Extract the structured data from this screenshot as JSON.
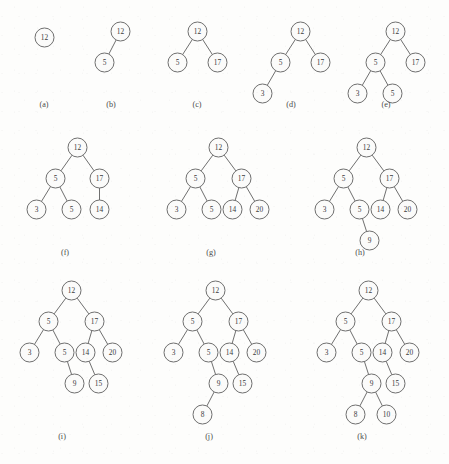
{
  "figure": {
    "background_color": "#fdfdfc",
    "node_stroke_color": "#6f6f6f",
    "node_fill_color": "#fbfbfa",
    "label_color": "#3a3a3a",
    "node_radius": 9.5,
    "insertion_sequence": [
      12,
      5,
      17,
      3,
      5,
      14,
      20,
      9,
      15,
      8,
      10
    ]
  },
  "trees": [
    {
      "caption": "(a)",
      "origin": {
        "x": 44,
        "y": 37
      },
      "caption_pos": {
        "x": 44,
        "y": 100
      },
      "nodes": [
        {
          "id": "a0",
          "value": "12",
          "x": 0,
          "y": 0
        }
      ],
      "edges": []
    },
    {
      "caption": "(b)",
      "origin": {
        "x": 120,
        "y": 31
      },
      "caption_pos": {
        "x": 111,
        "y": 100
      },
      "nodes": [
        {
          "id": "b0",
          "value": "12",
          "x": 0,
          "y": 0
        },
        {
          "id": "b1",
          "value": "5",
          "x": -16,
          "y": 31
        }
      ],
      "edges": [
        {
          "from": "b0",
          "to": "b1"
        }
      ]
    },
    {
      "caption": "(c)",
      "origin": {
        "x": 197,
        "y": 31
      },
      "caption_pos": {
        "x": 197,
        "y": 100
      },
      "nodes": [
        {
          "id": "c0",
          "value": "12",
          "x": 0,
          "y": 0
        },
        {
          "id": "c1",
          "value": "5",
          "x": -20,
          "y": 31
        },
        {
          "id": "c2",
          "value": "17",
          "x": 20,
          "y": 31
        }
      ],
      "edges": [
        {
          "from": "c0",
          "to": "c1"
        },
        {
          "from": "c0",
          "to": "c2"
        }
      ]
    },
    {
      "caption": "(d)",
      "origin": {
        "x": 300,
        "y": 31
      },
      "caption_pos": {
        "x": 291,
        "y": 100
      },
      "nodes": [
        {
          "id": "d0",
          "value": "12",
          "x": 0,
          "y": 0
        },
        {
          "id": "d1",
          "value": "5",
          "x": -20,
          "y": 31
        },
        {
          "id": "d2",
          "value": "17",
          "x": 20,
          "y": 31
        },
        {
          "id": "d3",
          "value": "3",
          "x": -38,
          "y": 62
        }
      ],
      "edges": [
        {
          "from": "d0",
          "to": "d1"
        },
        {
          "from": "d0",
          "to": "d2"
        },
        {
          "from": "d1",
          "to": "d3"
        }
      ]
    },
    {
      "caption": "(e)",
      "origin": {
        "x": 395,
        "y": 31
      },
      "caption_pos": {
        "x": 386,
        "y": 100
      },
      "nodes": [
        {
          "id": "e0",
          "value": "12",
          "x": 0,
          "y": 0
        },
        {
          "id": "e1",
          "value": "5",
          "x": -20,
          "y": 31
        },
        {
          "id": "e2",
          "value": "17",
          "x": 20,
          "y": 31
        },
        {
          "id": "e3",
          "value": "3",
          "x": -38,
          "y": 62
        },
        {
          "id": "e4",
          "value": "5",
          "x": -3,
          "y": 62
        }
      ],
      "edges": [
        {
          "from": "e0",
          "to": "e1"
        },
        {
          "from": "e0",
          "to": "e2"
        },
        {
          "from": "e1",
          "to": "e3"
        },
        {
          "from": "e1",
          "to": "e4"
        }
      ]
    },
    {
      "caption": "(f)",
      "origin": {
        "x": 77,
        "y": 147
      },
      "caption_pos": {
        "x": 65,
        "y": 248
      },
      "nodes": [
        {
          "id": "f0",
          "value": "12",
          "x": 0,
          "y": 0
        },
        {
          "id": "f1",
          "value": "5",
          "x": -22,
          "y": 31
        },
        {
          "id": "f2",
          "value": "17",
          "x": 22,
          "y": 31
        },
        {
          "id": "f3",
          "value": "3",
          "x": -41,
          "y": 62
        },
        {
          "id": "f4",
          "value": "5",
          "x": -6,
          "y": 62
        },
        {
          "id": "f5",
          "value": "14",
          "x": 22,
          "y": 62
        }
      ],
      "edges": [
        {
          "from": "f0",
          "to": "f1"
        },
        {
          "from": "f0",
          "to": "f2"
        },
        {
          "from": "f1",
          "to": "f3"
        },
        {
          "from": "f1",
          "to": "f4"
        },
        {
          "from": "f2",
          "to": "f5"
        }
      ]
    },
    {
      "caption": "(g)",
      "origin": {
        "x": 218,
        "y": 147
      },
      "caption_pos": {
        "x": 211,
        "y": 248
      },
      "nodes": [
        {
          "id": "g0",
          "value": "12",
          "x": 0,
          "y": 0
        },
        {
          "id": "g1",
          "value": "5",
          "x": -23,
          "y": 31
        },
        {
          "id": "g2",
          "value": "17",
          "x": 23,
          "y": 31
        },
        {
          "id": "g3",
          "value": "3",
          "x": -42,
          "y": 62
        },
        {
          "id": "g4",
          "value": "5",
          "x": -7,
          "y": 62
        },
        {
          "id": "g5",
          "value": "14",
          "x": 14,
          "y": 62
        },
        {
          "id": "g6",
          "value": "20",
          "x": 41,
          "y": 62
        }
      ],
      "edges": [
        {
          "from": "g0",
          "to": "g1"
        },
        {
          "from": "g0",
          "to": "g2"
        },
        {
          "from": "g1",
          "to": "g3"
        },
        {
          "from": "g1",
          "to": "g4"
        },
        {
          "from": "g2",
          "to": "g5"
        },
        {
          "from": "g2",
          "to": "g6"
        }
      ]
    },
    {
      "caption": "(h)",
      "origin": {
        "x": 366,
        "y": 147
      },
      "caption_pos": {
        "x": 360,
        "y": 248
      },
      "nodes": [
        {
          "id": "h0",
          "value": "12",
          "x": 0,
          "y": 0
        },
        {
          "id": "h1",
          "value": "5",
          "x": -23,
          "y": 31
        },
        {
          "id": "h2",
          "value": "17",
          "x": 23,
          "y": 31
        },
        {
          "id": "h3",
          "value": "3",
          "x": -42,
          "y": 62
        },
        {
          "id": "h4",
          "value": "5",
          "x": -7,
          "y": 62
        },
        {
          "id": "h5",
          "value": "14",
          "x": 14,
          "y": 62
        },
        {
          "id": "h6",
          "value": "20",
          "x": 41,
          "y": 62
        },
        {
          "id": "h7",
          "value": "9",
          "x": 3,
          "y": 93
        }
      ],
      "edges": [
        {
          "from": "h0",
          "to": "h1"
        },
        {
          "from": "h0",
          "to": "h2"
        },
        {
          "from": "h1",
          "to": "h3"
        },
        {
          "from": "h1",
          "to": "h4"
        },
        {
          "from": "h2",
          "to": "h5"
        },
        {
          "from": "h2",
          "to": "h6"
        },
        {
          "from": "h4",
          "to": "h7"
        }
      ]
    },
    {
      "caption": "(i)",
      "origin": {
        "x": 71,
        "y": 290
      },
      "caption_pos": {
        "x": 62,
        "y": 432
      },
      "nodes": [
        {
          "id": "i0",
          "value": "12",
          "x": 0,
          "y": 0
        },
        {
          "id": "i1",
          "value": "5",
          "x": -23,
          "y": 31
        },
        {
          "id": "i2",
          "value": "17",
          "x": 23,
          "y": 31
        },
        {
          "id": "i3",
          "value": "3",
          "x": -42,
          "y": 62
        },
        {
          "id": "i4",
          "value": "5",
          "x": -7,
          "y": 62
        },
        {
          "id": "i5",
          "value": "14",
          "x": 14,
          "y": 62
        },
        {
          "id": "i6",
          "value": "20",
          "x": 41,
          "y": 62
        },
        {
          "id": "i7",
          "value": "9",
          "x": 3,
          "y": 93
        },
        {
          "id": "i8",
          "value": "15",
          "x": 27,
          "y": 93
        }
      ],
      "edges": [
        {
          "from": "i0",
          "to": "i1"
        },
        {
          "from": "i0",
          "to": "i2"
        },
        {
          "from": "i1",
          "to": "i3"
        },
        {
          "from": "i1",
          "to": "i4"
        },
        {
          "from": "i2",
          "to": "i5"
        },
        {
          "from": "i2",
          "to": "i6"
        },
        {
          "from": "i4",
          "to": "i7"
        },
        {
          "from": "i5",
          "to": "i8"
        }
      ]
    },
    {
      "caption": "(j)",
      "origin": {
        "x": 215,
        "y": 290
      },
      "caption_pos": {
        "x": 209,
        "y": 432
      },
      "nodes": [
        {
          "id": "j0",
          "value": "12",
          "x": 0,
          "y": 0
        },
        {
          "id": "j1",
          "value": "5",
          "x": -23,
          "y": 31
        },
        {
          "id": "j2",
          "value": "17",
          "x": 23,
          "y": 31
        },
        {
          "id": "j3",
          "value": "3",
          "x": -42,
          "y": 62
        },
        {
          "id": "j4",
          "value": "5",
          "x": -7,
          "y": 62
        },
        {
          "id": "j5",
          "value": "14",
          "x": 14,
          "y": 62
        },
        {
          "id": "j6",
          "value": "20",
          "x": 41,
          "y": 62
        },
        {
          "id": "j7",
          "value": "9",
          "x": 3,
          "y": 93
        },
        {
          "id": "j8",
          "value": "15",
          "x": 27,
          "y": 93
        },
        {
          "id": "j9",
          "value": "8",
          "x": -13,
          "y": 124
        }
      ],
      "edges": [
        {
          "from": "j0",
          "to": "j1"
        },
        {
          "from": "j0",
          "to": "j2"
        },
        {
          "from": "j1",
          "to": "j3"
        },
        {
          "from": "j1",
          "to": "j4"
        },
        {
          "from": "j2",
          "to": "j5"
        },
        {
          "from": "j2",
          "to": "j6"
        },
        {
          "from": "j4",
          "to": "j7"
        },
        {
          "from": "j5",
          "to": "j8"
        },
        {
          "from": "j7",
          "to": "j9"
        }
      ]
    },
    {
      "caption": "(k)",
      "origin": {
        "x": 368,
        "y": 290
      },
      "caption_pos": {
        "x": 362,
        "y": 432
      },
      "nodes": [
        {
          "id": "k0",
          "value": "12",
          "x": 0,
          "y": 0
        },
        {
          "id": "k1",
          "value": "5",
          "x": -23,
          "y": 31
        },
        {
          "id": "k2",
          "value": "17",
          "x": 23,
          "y": 31
        },
        {
          "id": "k3",
          "value": "3",
          "x": -42,
          "y": 62
        },
        {
          "id": "k4",
          "value": "5",
          "x": -7,
          "y": 62
        },
        {
          "id": "k5",
          "value": "14",
          "x": 14,
          "y": 62
        },
        {
          "id": "k6",
          "value": "20",
          "x": 41,
          "y": 62
        },
        {
          "id": "k7",
          "value": "9",
          "x": 3,
          "y": 93
        },
        {
          "id": "k8",
          "value": "15",
          "x": 27,
          "y": 93
        },
        {
          "id": "k9",
          "value": "8",
          "x": -13,
          "y": 124
        },
        {
          "id": "k10",
          "value": "10",
          "x": 18,
          "y": 124
        }
      ],
      "edges": [
        {
          "from": "k0",
          "to": "k1"
        },
        {
          "from": "k0",
          "to": "k2"
        },
        {
          "from": "k1",
          "to": "k3"
        },
        {
          "from": "k1",
          "to": "k4"
        },
        {
          "from": "k2",
          "to": "k5"
        },
        {
          "from": "k2",
          "to": "k6"
        },
        {
          "from": "k4",
          "to": "k7"
        },
        {
          "from": "k5",
          "to": "k8"
        },
        {
          "from": "k7",
          "to": "k9"
        },
        {
          "from": "k7",
          "to": "k10"
        }
      ]
    }
  ]
}
